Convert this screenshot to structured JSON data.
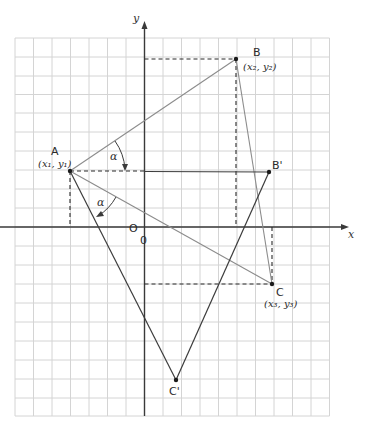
{
  "diagram": {
    "axes": {
      "x_label": "x",
      "y_label": "y",
      "origin_label": "O",
      "origin_label_2": "0"
    },
    "points": {
      "A": {
        "label": "A",
        "coords": "(x₁, y₁)"
      },
      "B": {
        "label": "B",
        "coords": "(x₂, y₂)"
      },
      "C": {
        "label": "C",
        "coords": "(x₃, y₃)"
      },
      "B_prime": {
        "label": "B'"
      },
      "C_prime": {
        "label": "C'"
      }
    },
    "angles": {
      "upper": "α",
      "lower": "α"
    },
    "colors": {
      "grid": "#d4d4d4",
      "original_triangle": "#8c8c8c",
      "rotated_triangle": "#3c3c3c",
      "guides": "#2b2b2b"
    }
  }
}
